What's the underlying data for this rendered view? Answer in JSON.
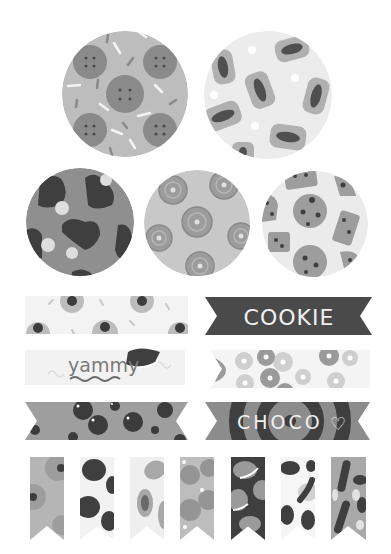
{
  "sheet": {
    "background": "#ffffff",
    "circles": [
      {
        "id": "biscuit-circle",
        "cx": 125,
        "cy": 94,
        "r": 63,
        "bg": "#bdbdbd",
        "motif": "biscuits",
        "motif_color": "#8a8a8a"
      },
      {
        "id": "jellybean-circle",
        "cx": 268,
        "cy": 95,
        "r": 64,
        "bg": "#ececec",
        "motif": "jelly-candies",
        "motif_color": "#9a9a9a"
      },
      {
        "id": "choc-heart-circle",
        "cx": 80,
        "cy": 222,
        "r": 54,
        "bg": "#8f8f8f",
        "motif": "chocolate-hearts",
        "motif_color": "#3f3f3f"
      },
      {
        "id": "swirl-cookie-circle",
        "cx": 197,
        "cy": 223,
        "r": 53,
        "bg": "#c8c8c8",
        "motif": "swirl-cookies",
        "motif_color": "#9c9c9c"
      },
      {
        "id": "chip-cookie-circle",
        "cx": 315,
        "cy": 224,
        "r": 53,
        "bg": "#ebebeb",
        "motif": "chocolate-chip-cookies",
        "motif_color": "#9d9d9d"
      }
    ],
    "tapes": [
      {
        "id": "eyeball-tape",
        "x": 25,
        "y": 296,
        "w": 163,
        "h": 38,
        "bg": "#f3f3f3",
        "motif": "candy-drops",
        "style": "straight"
      },
      {
        "id": "cookie-banner",
        "x": 205,
        "y": 297,
        "w": 167,
        "h": 38,
        "bg": "#4a4a4a",
        "style": "notched",
        "label": "COOKIE",
        "text_color": "#f0f0f0"
      },
      {
        "id": "yammy-tape",
        "x": 25,
        "y": 350,
        "w": 160,
        "h": 35,
        "bg": "#f2f2f2",
        "style": "straight",
        "label": "yammy",
        "text_color": "#7a7a7a"
      },
      {
        "id": "donut-tape",
        "x": 210,
        "y": 350,
        "w": 160,
        "h": 38,
        "bg": "#f4f4f4",
        "motif": "donuts",
        "style": "left-notch"
      },
      {
        "id": "choc-chip-banner",
        "x": 25,
        "y": 402,
        "w": 163,
        "h": 38,
        "bg": "#9e9e9e",
        "motif": "chocolate-balls",
        "style": "notched"
      },
      {
        "id": "choco-banner",
        "x": 205,
        "y": 402,
        "w": 165,
        "h": 38,
        "bg": "#8c8c8c",
        "style": "notched",
        "label": "CHOCO",
        "text_color": "#f0f0f0",
        "heart": "♡"
      }
    ],
    "flags": [
      {
        "id": "flag-1",
        "x": 30,
        "bg": "#b5b5b5",
        "motif": "candy-drops"
      },
      {
        "id": "flag-2",
        "x": 80,
        "bg": "#f2f2f2",
        "motif": "dark-beans"
      },
      {
        "id": "flag-3",
        "x": 130,
        "bg": "#efefef",
        "motif": "jelly-candies"
      },
      {
        "id": "flag-4",
        "x": 180,
        "bg": "#bdbdbd",
        "motif": "biscuits"
      },
      {
        "id": "flag-5",
        "x": 231,
        "bg": "#3f3f3f",
        "motif": "sandwich-cookies"
      },
      {
        "id": "flag-6",
        "x": 281,
        "bg": "#f6f6f6",
        "motif": "dark-beans-ring"
      },
      {
        "id": "flag-7",
        "x": 331,
        "bg": "#a8a8a8",
        "motif": "chocolate-sticks"
      }
    ],
    "flag_geometry": {
      "y": 457,
      "w": 34,
      "h": 83,
      "notch": 14
    }
  }
}
